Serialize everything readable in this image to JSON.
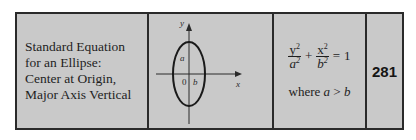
{
  "entry": {
    "title_lines": [
      "Standard Equation",
      "for an Ellipse:",
      "Center at Origin,",
      "Major Axis Vertical"
    ],
    "diagram": {
      "axis_labels": {
        "x": "x",
        "y": "y"
      },
      "segment_labels": {
        "a": "a",
        "b": "b",
        "origin": "0"
      },
      "shape": "vertical-ellipse"
    },
    "formula": {
      "term1_num_var": "y",
      "term1_num_exp": "2",
      "term1_den_var": "a",
      "term1_den_exp": "2",
      "plus": "+",
      "term2_num_var": "x",
      "term2_num_exp": "2",
      "term2_den_var": "b",
      "term2_den_exp": "2",
      "equals": "=",
      "rhs": "1",
      "condition_prefix": "where",
      "condition_lhs": "a",
      "condition_op": ">",
      "condition_rhs": "b"
    },
    "page_number": "281"
  },
  "colors": {
    "background": "#c9c9c9",
    "border": "#2a2a2a",
    "text": "#1e1e1e"
  }
}
